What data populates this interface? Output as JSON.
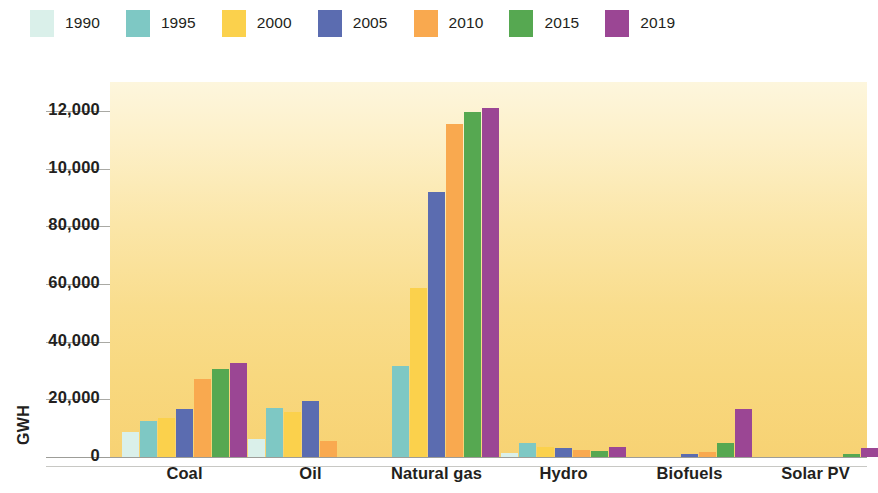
{
  "chart_data": {
    "type": "bar",
    "title": "",
    "subtitle": "",
    "xlabel": "",
    "ylabel": "GWH",
    "ylim": [
      0,
      130000
    ],
    "grid": true,
    "legend_position": "top-left",
    "ytick_labels": [
      "12,000",
      "10,000",
      "80,000",
      "60,000",
      "40,000",
      "20,000",
      "0"
    ],
    "ytick_values": [
      120000,
      100000,
      80000,
      60000,
      40000,
      20000,
      0
    ],
    "categories": [
      "Coal",
      "Oil",
      "Natural gas",
      "Hydro",
      "Biofuels",
      "Solar PV"
    ],
    "series": [
      {
        "name": "1990",
        "color": "#daf0ea",
        "values": [
          8500,
          6200,
          0,
          1500,
          0,
          0
        ]
      },
      {
        "name": "1995",
        "color": "#7ec8c4",
        "values": [
          12500,
          17000,
          31500,
          5000,
          0,
          0
        ]
      },
      {
        "name": "2000",
        "color": "#fbd14c",
        "values": [
          13500,
          15500,
          58500,
          3500,
          0,
          0
        ]
      },
      {
        "name": "2005",
        "color": "#5b6cb0",
        "values": [
          16500,
          19500,
          92000,
          3200,
          1000,
          0
        ]
      },
      {
        "name": "2010",
        "color": "#f9a94f",
        "values": [
          27000,
          5500,
          115500,
          2600,
          1600,
          0
        ]
      },
      {
        "name": "2015",
        "color": "#56a851",
        "values": [
          30500,
          0,
          119500,
          2100,
          5000,
          1200
        ]
      },
      {
        "name": "2019",
        "color": "#9b4694",
        "values": [
          32500,
          0,
          121000,
          3300,
          16500,
          3000
        ]
      }
    ]
  },
  "legend": {
    "items": [
      {
        "label": "1990",
        "color": "#daf0ea"
      },
      {
        "label": "1995",
        "color": "#7ec8c4"
      },
      {
        "label": "2000",
        "color": "#fbd14c"
      },
      {
        "label": "2005",
        "color": "#5b6cb0"
      },
      {
        "label": "2010",
        "color": "#f9a94f"
      },
      {
        "label": "2015",
        "color": "#56a851"
      },
      {
        "label": "2019",
        "color": "#9b4694"
      }
    ]
  },
  "axis": {
    "y_title": "GWH"
  }
}
